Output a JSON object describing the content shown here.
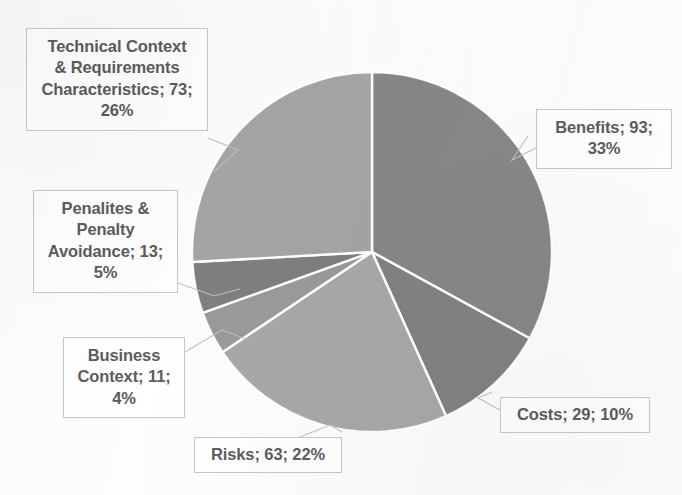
{
  "chart_data": {
    "type": "pie",
    "title": "",
    "subtitle": "",
    "xlabel": "",
    "ylabel": "",
    "legend_position": "none",
    "grid": false,
    "total": 282,
    "categories": [
      "Benefits",
      "Costs",
      "Risks",
      "Business Context",
      "Penalites & Penalty Avoidance",
      "Technical Context & Requirements Characteristics"
    ],
    "values": [
      93,
      29,
      63,
      11,
      13,
      73
    ],
    "percentages": [
      33,
      10,
      22,
      4,
      5,
      26
    ],
    "slice_colors": [
      "#878787",
      "#828282",
      "#a8a8a8",
      "#9a9a9a",
      "#7f7f7f",
      "#a5a5a5"
    ],
    "separator_color": "#ffffff",
    "slices": [
      {
        "name": "Benefits",
        "value": 93,
        "percent": 33,
        "color": "#878787",
        "start_angle": 0,
        "end_angle": 118.7,
        "label_lines": [
          "Benefits; 93;",
          "33%"
        ]
      },
      {
        "name": "Costs",
        "value": 29,
        "percent": 10,
        "color": "#828282",
        "start_angle": 118.7,
        "end_angle": 155.7,
        "label_lines": [
          "Costs; 29; 10%"
        ]
      },
      {
        "name": "Risks",
        "value": 63,
        "percent": 22,
        "color": "#a8a8a8",
        "start_angle": 155.7,
        "end_angle": 236.2,
        "label_lines": [
          "Risks; 63; 22%"
        ]
      },
      {
        "name": "Business Context",
        "value": 11,
        "percent": 4,
        "color": "#9a9a9a",
        "start_angle": 236.2,
        "end_angle": 250.2,
        "label_lines": [
          "Business",
          "Context; 11;",
          "4%"
        ]
      },
      {
        "name": "Penalites & Penalty Avoidance",
        "value": 13,
        "percent": 5,
        "color": "#7f7f7f",
        "start_angle": 250.2,
        "end_angle": 266.8,
        "label_lines": [
          "Penalites &",
          "Penalty",
          "Avoidance; 13;",
          "5%"
        ]
      },
      {
        "name": "Technical Context & Requirements Characteristics",
        "value": 73,
        "percent": 26,
        "color": "#a5a5a5",
        "start_angle": 266.8,
        "end_angle": 360,
        "label_lines": [
          "Technical Context",
          "& Requirements",
          "Characteristics; 73;",
          "26%"
        ]
      }
    ]
  },
  "labels": {
    "technical": {
      "line1": "Technical Context",
      "line2": "& Requirements",
      "line3": "Characteristics; 73;",
      "line4": "26%"
    },
    "penalties": {
      "line1": "Penalites &",
      "line2": "Penalty",
      "line3": "Avoidance; 13;",
      "line4": "5%"
    },
    "business": {
      "line1": "Business",
      "line2": "Context; 11;",
      "line3": "4%"
    },
    "risks": {
      "line1": "Risks; 63; 22%"
    },
    "costs": {
      "line1": "Costs; 29; 10%"
    },
    "benefits": {
      "line1": "Benefits; 93;",
      "line2": "33%"
    }
  },
  "geometry": {
    "center_x": 372,
    "center_y": 252,
    "radius": 180
  },
  "colors": {
    "background": "#fdfdfd",
    "label_text": "#5c5c5c",
    "label_border": "#c8c8c8",
    "leader_line": "#c0c0c0"
  }
}
